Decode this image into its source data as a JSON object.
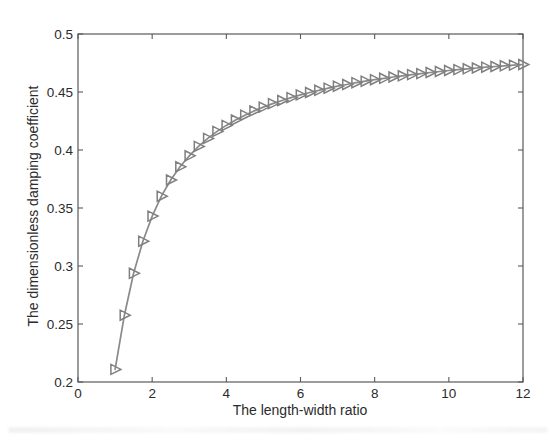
{
  "figure": {
    "background_color": "#ffffff",
    "line_color": "#8a8a8a",
    "marker_color": "#7f7f7f",
    "axis_color": "#5a5a5a",
    "text_color": "#2b2b2b"
  },
  "chart_data": {
    "type": "line",
    "title": "",
    "xlabel": "The length-width ratio",
    "ylabel": "The dimensionless damping coefficient",
    "xlim": [
      0,
      12
    ],
    "ylim": [
      0.2,
      0.5
    ],
    "x_tick_labels": [
      "0",
      "2",
      "4",
      "6",
      "8",
      "10",
      "12"
    ],
    "x_tick_values": [
      0,
      2,
      4,
      6,
      8,
      10,
      12
    ],
    "y_tick_labels": [
      "0.2",
      "0.25",
      "0.3",
      "0.35",
      "0.4",
      "0.45",
      "0.5"
    ],
    "y_tick_values": [
      0.2,
      0.25,
      0.3,
      0.35,
      0.4,
      0.45,
      0.5
    ],
    "grid": false,
    "legend": null,
    "marker": "right-triangle",
    "series": [
      {
        "name": "dimensionless damping coefficient",
        "x": [
          1,
          1.25,
          1.5,
          1.75,
          2,
          2.25,
          2.5,
          2.75,
          3,
          3.25,
          3.5,
          3.75,
          4,
          4.25,
          4.5,
          4.75,
          5,
          5.25,
          5.5,
          5.75,
          6,
          6.25,
          6.5,
          6.75,
          7,
          7.25,
          7.5,
          7.75,
          8,
          8.25,
          8.5,
          8.75,
          9,
          9.25,
          9.5,
          9.75,
          10,
          10.25,
          10.5,
          10.75,
          11,
          11.25,
          11.5,
          11.75,
          12
        ],
        "y": [
          0.2109,
          0.2576,
          0.2937,
          0.3214,
          0.343,
          0.3602,
          0.3741,
          0.3855,
          0.395,
          0.4031,
          0.41,
          0.416,
          0.4212,
          0.4259,
          0.43,
          0.4337,
          0.437,
          0.44,
          0.4427,
          0.4452,
          0.4475,
          0.4496,
          0.4515,
          0.4533,
          0.455,
          0.4565,
          0.458,
          0.4593,
          0.4606,
          0.4618,
          0.4629,
          0.464,
          0.465,
          0.4659,
          0.4668,
          0.4677,
          0.4685,
          0.4693,
          0.47,
          0.4707,
          0.4714,
          0.472,
          0.4726,
          0.4732,
          0.4737
        ]
      }
    ]
  }
}
